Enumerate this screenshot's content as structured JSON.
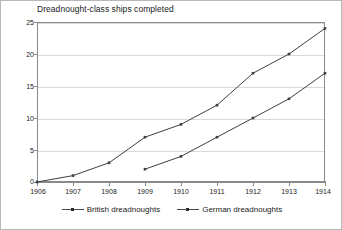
{
  "chart_data": {
    "type": "line",
    "title": "Dreadnought-class ships completed",
    "xlabel": "",
    "ylabel": "",
    "x": [
      1906,
      1907,
      1908,
      1909,
      1910,
      1911,
      1912,
      1913,
      1914
    ],
    "xtick_labels": [
      "1906",
      "1907",
      "1908",
      "1909",
      "1910",
      "1911",
      "1912",
      "1913",
      "1914"
    ],
    "ytick_labels": [
      "0",
      "5",
      "10",
      "15",
      "20",
      "25"
    ],
    "yticks": [
      0,
      5,
      10,
      15,
      20,
      25
    ],
    "ylim": [
      0,
      25
    ],
    "xlim": [
      1906,
      1914
    ],
    "grid": "horizontal",
    "legend_position": "bottom-center",
    "series": [
      {
        "name": "British dreadnoughts",
        "x": [
          1906,
          1907,
          1908,
          1909,
          1910,
          1911,
          1912,
          1913,
          1914
        ],
        "values": [
          0,
          1,
          3,
          7,
          9,
          12,
          17,
          20,
          24
        ],
        "color": "#3f3f3f",
        "marker": "dot"
      },
      {
        "name": "German dreadnoughts",
        "x": [
          1909,
          1910,
          1911,
          1912,
          1913,
          1914
        ],
        "values": [
          2,
          4,
          7,
          10,
          13,
          17
        ],
        "color": "#3f3f3f",
        "marker": "dot"
      }
    ]
  },
  "legend": {
    "entries": [
      {
        "label": "British dreadnoughts"
      },
      {
        "label": "German dreadnoughts"
      }
    ]
  }
}
